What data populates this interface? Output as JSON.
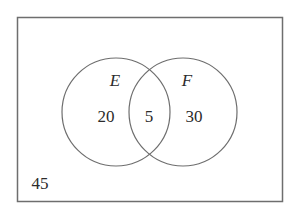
{
  "diagram": {
    "type": "venn",
    "universe": {
      "outside_count": "45"
    },
    "sets": [
      {
        "name": "E",
        "only_count": "20"
      },
      {
        "name": "F",
        "only_count": "30"
      }
    ],
    "intersection_count": "5",
    "colors": {
      "stroke": "#6e6e6e",
      "text": "#2b2b2b",
      "background": "#ffffff"
    }
  }
}
